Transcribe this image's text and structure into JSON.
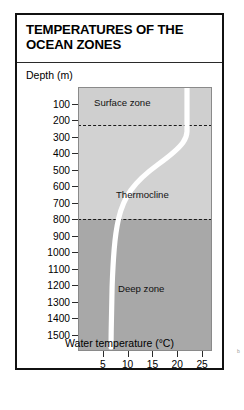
{
  "figure": {
    "title": "TEMPERATURES OF THE OCEAN ZONES",
    "y_axis_title": "Depth (m)",
    "x_axis_title": "Water temperature (°C)",
    "edge_mark": "b"
  },
  "colors": {
    "surface_zone_fill": "#cfcfcf",
    "thermocline_fill": "#d2d2d2",
    "deep_zone_fill": "#a8a8a8",
    "curve": "#ffffff",
    "zone_divider": "#1a1a1a",
    "frame": "#111111",
    "text": "#000000"
  },
  "chart_data": {
    "type": "line",
    "title": "TEMPERATURES OF THE OCEAN ZONES",
    "xlabel": "Water temperature (°C)",
    "ylabel": "Depth (m)",
    "xlim": [
      0,
      27
    ],
    "ylim": [
      0,
      1600
    ],
    "y_inverted": true,
    "grid": false,
    "legend": null,
    "xticks": [
      5,
      10,
      15,
      20,
      25
    ],
    "yticks": [
      100,
      200,
      300,
      400,
      500,
      600,
      700,
      800,
      900,
      1000,
      1100,
      1200,
      1300,
      1400,
      1500
    ],
    "series": [
      {
        "name": "Water temperature profile",
        "color": "#ffffff",
        "x": [
          22.0,
          22.0,
          22.0,
          21.9,
          21.4,
          19.6,
          16.2,
          12.6,
          9.8,
          7.8,
          6.5,
          5.7,
          5.2,
          4.8,
          4.5,
          4.3,
          4.1,
          4.0
        ],
        "y": [
          0,
          150,
          270,
          300,
          330,
          380,
          440,
          500,
          560,
          630,
          700,
          800,
          900,
          1000,
          1150,
          1300,
          1450,
          1560
        ]
      }
    ],
    "zones": [
      {
        "label": "Surface zone",
        "depth_from": 0,
        "depth_to": 300,
        "fill": "#cfcfcf"
      },
      {
        "label": "Thermocline",
        "depth_from": 300,
        "depth_to": 800,
        "fill": "#d2d2d2"
      },
      {
        "label": "Deep zone",
        "depth_from": 800,
        "depth_to": 1600,
        "fill": "#a8a8a8"
      }
    ],
    "zone_boundaries": [
      300,
      800
    ],
    "annotations": [
      {
        "text": "Surface zone",
        "depth": 130,
        "temperature": 9.0
      },
      {
        "text": "Thermocline",
        "depth": 590,
        "temperature": 15.5
      },
      {
        "text": "Deep zone",
        "depth": 1175,
        "temperature": 16.0
      }
    ]
  }
}
